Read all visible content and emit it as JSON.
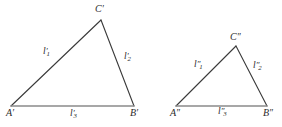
{
  "figure": {
    "caption_visible": false,
    "background_color": "#ffffff",
    "line_color": "#3a3a3a",
    "baseline_color": "#8a8a8a",
    "text_color": "#2b2b2b",
    "triangles": [
      {
        "id": "triangle-prime",
        "vertices": {
          "A": {
            "label": "A′",
            "x": 11,
            "y": 106
          },
          "B": {
            "label": "B′",
            "x": 134,
            "y": 106
          },
          "C": {
            "label": "C′",
            "x": 101,
            "y": 20
          }
        },
        "sides": [
          {
            "id": "side-l1-prime",
            "base": "l",
            "sub": "1",
            "prime": "′",
            "label": "l′1"
          },
          {
            "id": "side-l2-prime",
            "base": "l",
            "sub": "2",
            "prime": "′",
            "label": "l′2"
          },
          {
            "id": "side-l3-prime",
            "base": "l",
            "sub": "3",
            "prime": "′",
            "label": "l′3"
          }
        ]
      },
      {
        "id": "triangle-double-prime",
        "vertices": {
          "A": {
            "label": "A″",
            "x": 176,
            "y": 106
          },
          "B": {
            "label": "B″",
            "x": 267,
            "y": 106
          },
          "C": {
            "label": "C″",
            "x": 236,
            "y": 46
          }
        },
        "sides": [
          {
            "id": "side-l1-double-prime",
            "base": "l",
            "sub": "1",
            "prime": "″",
            "label": "l″1"
          },
          {
            "id": "side-l2-double-prime",
            "base": "l",
            "sub": "2",
            "prime": "″",
            "label": "l″2"
          },
          {
            "id": "side-l3-double-prime",
            "base": "l",
            "sub": "3",
            "prime": "″",
            "label": "l″3"
          }
        ]
      }
    ],
    "labels": {
      "a_prime": "A",
      "b_prime": "B",
      "c_prime": "C",
      "a_double_prime": "A",
      "b_double_prime": "B",
      "c_double_prime": "C",
      "prime_mark": "′",
      "double_prime_mark": "″",
      "l": "l",
      "sub1": "1",
      "sub2": "2",
      "sub3": "3"
    }
  }
}
